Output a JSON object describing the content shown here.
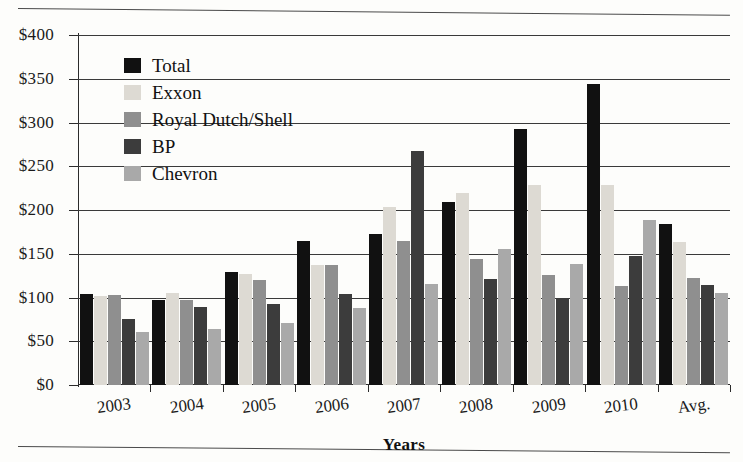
{
  "chart_data": {
    "type": "bar",
    "title": "",
    "xlabel": "Years",
    "ylabel": "",
    "categories": [
      "2003",
      "2004",
      "2005",
      "2006",
      "2007",
      "2008",
      "2009",
      "2010",
      "Avg."
    ],
    "series": [
      {
        "name": "Total",
        "color": "#111111",
        "values": [
          104,
          97,
          129,
          165,
          173,
          209,
          293,
          344,
          184
        ]
      },
      {
        "name": "Exxon",
        "color": "#dddad3",
        "values": [
          102,
          105,
          127,
          137,
          203,
          220,
          229,
          229,
          164
        ]
      },
      {
        "name": "Royal Dutch/Shell",
        "color": "#8f8f8f",
        "values": [
          103,
          97,
          120,
          137,
          165,
          144,
          126,
          113,
          122
        ]
      },
      {
        "name": "BP",
        "color": "#3c3c3c",
        "values": [
          75,
          89,
          93,
          104,
          267,
          121,
          100,
          147,
          114
        ]
      },
      {
        "name": "Chevron",
        "color": "#a9a9a9",
        "values": [
          61,
          64,
          71,
          88,
          115,
          155,
          138,
          189,
          105
        ]
      }
    ],
    "ylim": [
      0,
      400
    ],
    "yticks": [
      0,
      50,
      100,
      150,
      200,
      250,
      300,
      350,
      400
    ],
    "ytick_labels": [
      "$0",
      "$50",
      "$100",
      "$150",
      "$200",
      "$250",
      "$300",
      "$350",
      "$400"
    ],
    "grid": true,
    "legend_position": "top-left",
    "legend_entries": [
      {
        "label": "Total",
        "swatch": "#111111"
      },
      {
        "label": "Exxon",
        "swatch": "#dddad3"
      },
      {
        "label": "Royal Dutch/Shell",
        "swatch": "#8f8f8f"
      },
      {
        "label": "BP",
        "swatch": "#3c3c3c"
      },
      {
        "label": "Chevron",
        "swatch": "#a9a9a9"
      }
    ]
  }
}
